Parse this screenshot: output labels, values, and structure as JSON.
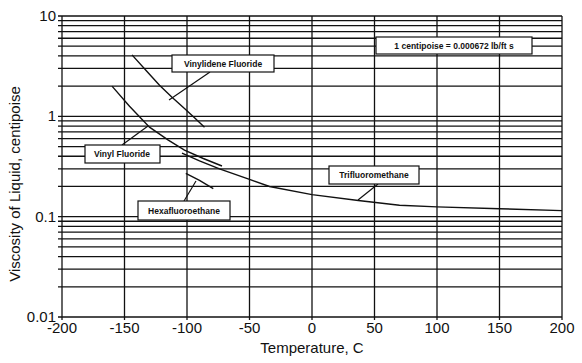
{
  "chart_data": {
    "type": "line",
    "title": "",
    "xlabel": "Temperature, C",
    "ylabel": "Viscosity of Liquid, centipoise",
    "xlim": [
      -200,
      200
    ],
    "ylim": [
      0.01,
      10
    ],
    "yscale": "log",
    "grid": true,
    "x_ticks": [
      "-200",
      "-150",
      "-100",
      "-50",
      "0",
      "50",
      "100",
      "150",
      "200"
    ],
    "y_ticks": [
      "0.01",
      "0.1",
      "1",
      "10"
    ],
    "annotations": [
      "1 centipoise = 0.000672 lb/ft s"
    ],
    "series": [
      {
        "name": "Vinylidene Fluoride",
        "x": [
          -144,
          -132,
          -122,
          -112,
          -102,
          -94,
          -86
        ],
        "y": [
          4.1,
          2.8,
          2.04,
          1.55,
          1.2,
          0.97,
          0.78
        ]
      },
      {
        "name": "Vinyl Fluoride",
        "x": [
          -160,
          -146,
          -130,
          -115,
          -102,
          -87,
          -72
        ],
        "y": [
          2.0,
          1.26,
          0.78,
          0.58,
          0.46,
          0.38,
          0.32
        ]
      },
      {
        "name": "Trifluoromethane",
        "x": [
          -104,
          -90,
          -74,
          -50,
          -34,
          0,
          37,
          70,
          100,
          150,
          200
        ],
        "y": [
          0.43,
          0.36,
          0.3,
          0.235,
          0.2,
          0.166,
          0.145,
          0.13,
          0.125,
          0.12,
          0.115
        ]
      },
      {
        "name": "Hexafluoroethane",
        "x": [
          -101,
          -90,
          -79
        ],
        "y": [
          0.27,
          0.23,
          0.19
        ]
      }
    ]
  },
  "labels": {
    "vinylidene": "Vinylidene Fluoride",
    "vinyl": "Vinyl Fluoride",
    "trifluoro": "Trifluoromethane",
    "hexafluoro": "Hexafluoroethane",
    "conversion": "1 centipoise = 0.000672 lb/ft s"
  },
  "axes": {
    "xlabel": "Temperature, C",
    "ylabel": "Viscosity of Liquid, centipoise",
    "x_ticks": [
      "-200",
      "-150",
      "-100",
      "-50",
      "0",
      "50",
      "100",
      "150",
      "200"
    ],
    "y_ticks": [
      "10",
      "1",
      "0.1",
      "0.01"
    ]
  }
}
